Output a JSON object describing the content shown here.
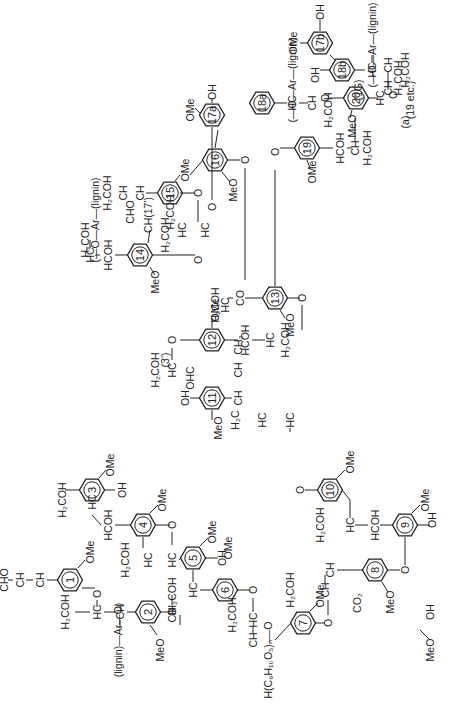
{
  "figure": {
    "orientation": "rotated-90-ccw",
    "panel_label": "(a)"
  },
  "units": [
    {
      "id": "1",
      "label": "1",
      "substituents": [
        "OMe",
        "CH=CH-CHO"
      ]
    },
    {
      "id": "2",
      "label": "2",
      "substituents": [
        "MeO"
      ]
    },
    {
      "id": "3",
      "label": "3",
      "substituents": [
        "OMe",
        "OH"
      ]
    },
    {
      "id": "4",
      "label": "4",
      "substituents": [
        "OMe"
      ]
    },
    {
      "id": "5",
      "label": "5",
      "substituents": [
        "OMe",
        "OH"
      ]
    },
    {
      "id": "6",
      "label": "6",
      "substituents": [
        "OMe"
      ]
    },
    {
      "id": "7",
      "label": "7",
      "substituents": [
        "OMe"
      ]
    },
    {
      "id": "8",
      "label": "8",
      "substituents": [
        "MeO"
      ]
    },
    {
      "id": "9",
      "label": "9",
      "substituents": [
        "OMe",
        "OH"
      ]
    },
    {
      "id": "10",
      "label": "10",
      "substituents": [
        "OMe"
      ]
    },
    {
      "id": "11",
      "label": "11",
      "substituents": [
        "MeO",
        "OH"
      ]
    },
    {
      "id": "12",
      "label": "12",
      "substituents": [
        "OMe"
      ]
    },
    {
      "id": "13",
      "label": "13",
      "substituents": [
        "MeO"
      ]
    },
    {
      "id": "14",
      "label": "14",
      "substituents": [
        "MeO"
      ]
    },
    {
      "id": "15",
      "label": "15",
      "substituents": [
        "OMe"
      ]
    },
    {
      "id": "16",
      "label": "16",
      "substituents": [
        "MeO"
      ]
    },
    {
      "id": "17a",
      "label": "17a",
      "substituents": [
        "OMe",
        "OH"
      ]
    },
    {
      "id": "18a",
      "label": "18a",
      "substituents": []
    },
    {
      "id": "19",
      "label": "19",
      "substituents": [
        "OMe"
      ]
    },
    {
      "id": "20",
      "label": "20",
      "substituents": [
        "MeO"
      ]
    },
    {
      "id": "17b",
      "label": "17b",
      "substituents": [
        "OMe",
        "OH"
      ]
    },
    {
      "id": "18b",
      "label": "18b",
      "substituents": [
        "OH"
      ]
    }
  ],
  "labels": {
    "cho": "CHO",
    "ch": "CH",
    "hc": "HC",
    "h2coh": "H₂COH",
    "hcoh": "HCOH",
    "ome": "OMe",
    "meo": "MeO",
    "oh": "OH",
    "ho": "HO",
    "o": "O",
    "co": "CO",
    "co2": "CO₂",
    "ohc": "OHC",
    "ch2": "CH₂",
    "h2c": "H₂C",
    "lignin_link_left": "(lignin)—Ar—O)",
    "cellulose": "H(C₆H₁₀O₅)ₙ—O",
    "ar_lignin": "(—O—Ar—(lignin)",
    "ch17": "CH(17')",
    "ref3": "(3')",
    "ref1g": "(1G)",
    "ref19": "(19 etc.)"
  }
}
